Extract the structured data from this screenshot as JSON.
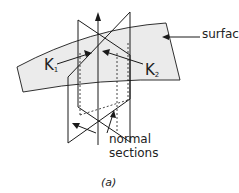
{
  "diagram": {
    "labels": {
      "surface": "surface",
      "k1_main": "K",
      "k1_sub": "1",
      "k2_main": "K",
      "k2_sub": "2",
      "normal_line1": "normal",
      "normal_line2": "sections",
      "figure_tag": "(a)"
    },
    "colors": {
      "surface_fill": "#ebebeb",
      "stroke": "#1a1a1a"
    }
  }
}
